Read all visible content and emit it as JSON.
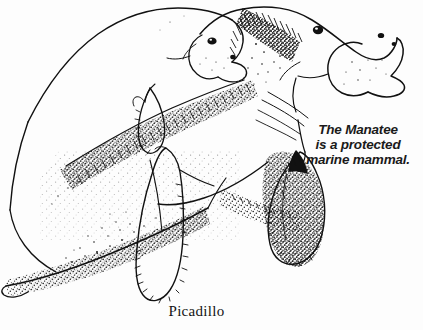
{
  "illustration": {
    "title": "manatee-mother-and-calf-line-drawing",
    "subject": "Two manatees, an adult and a calf swimming together",
    "style": "black ink line drawing with stipple shading on white background",
    "background_color": "#fdfdfd",
    "ink_color": "#111111"
  },
  "caption": {
    "line1": "The Manatee",
    "line2": "is a protected",
    "line3": "marine mammal."
  },
  "signature": {
    "artist": "Picadillo"
  }
}
